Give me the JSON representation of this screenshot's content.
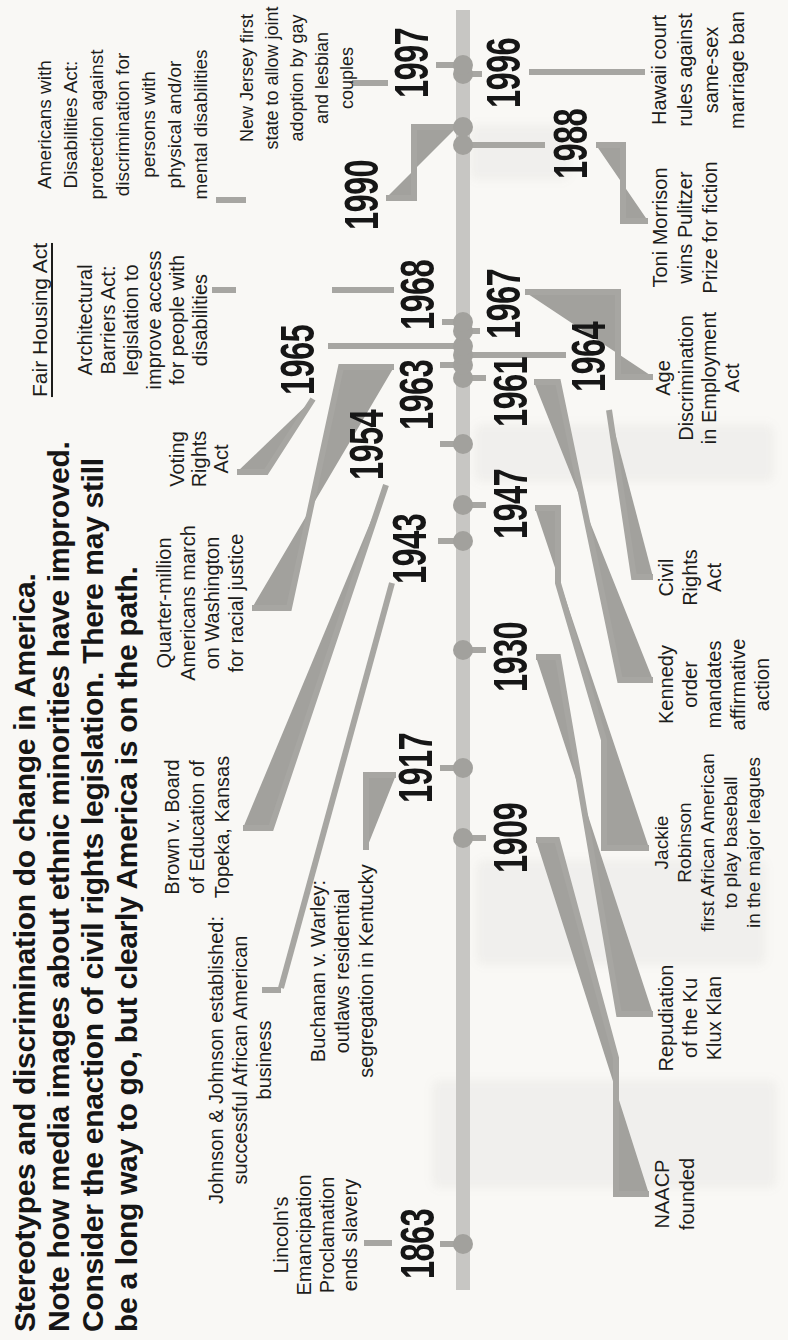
{
  "colors": {
    "ink": "#161616",
    "label": "#1d1d1b",
    "bar": "#c7c6c3",
    "dot": "#a2a19d",
    "line": "#a7a6a2",
    "paper": "#f9f8f5"
  },
  "title": {
    "text": "Stereotypes and discrimination do change in America.\nNote how media images about ethnic minorities have improved.\nConsider the enaction of civil rights legislation. There may still\nbe a long way to go, but clearly America is on the path."
  },
  "timeline": {
    "first_year": "1863",
    "last_year": "1997"
  },
  "events": [
    {
      "year": "1863",
      "side": "above",
      "label": "Lincoln's\nEmancipation\nProclamation\nends slavery"
    },
    {
      "year": "1909",
      "side": "below",
      "label": "NAACP\nfounded"
    },
    {
      "year": "1917",
      "side": "above",
      "label": "Buchanan v. Warley:\noutlaws residential\nsegregation in Kentucky"
    },
    {
      "year": "1930",
      "side": "below",
      "label": "Repudiation\nof the Ku\nKlux Klan"
    },
    {
      "year": "1943",
      "side": "above",
      "label": "Johnson & Johnson established:\nsuccessful African American\nbusiness"
    },
    {
      "year": "1947",
      "side": "below",
      "label": "Jackie\nRobinson\nfirst African American\nto play baseball\nin the major leagues"
    },
    {
      "year": "1954",
      "side": "above",
      "label": "Brown v. Board\nof Education of\nTopeka, Kansas"
    },
    {
      "year": "1961",
      "side": "below",
      "label": "Kennedy\norder\nmandates\naffirmative\naction"
    },
    {
      "year": "1963",
      "side": "above",
      "label": "Quarter-million\nAmericans march\non Washington\nfor racial justice"
    },
    {
      "year": "1964",
      "side": "below",
      "label": "Civil\nRights\nAct"
    },
    {
      "year": "1965",
      "side": "above",
      "label": "Voting\nRights\nAct"
    },
    {
      "year": "1967",
      "side": "below",
      "label": "Age\nDiscrimination\nin Employment\nAct"
    },
    {
      "year": "1968",
      "side": "above",
      "label_heading": "Fair Housing Act",
      "label": "Architectural\nBarriers Act:\nlegislation to\nimprove access\nfor people with\ndisabilities"
    },
    {
      "year": "1988",
      "side": "below",
      "label": "Toni Morrison\nwins Pulitzer\nPrize for fiction"
    },
    {
      "year": "1990",
      "side": "above",
      "label": "Americans with\nDisabilities Act:\nprotection against\ndiscrimination for\npersons with\nphysical and/or\nmental disabilities"
    },
    {
      "year": "1996",
      "side": "below",
      "label": "Hawaii court\nrules against\nsame-sex\nmarriage ban"
    },
    {
      "year": "1997",
      "side": "above",
      "label": "New Jersey first\nstate to allow joint\nadoption by gay\nand lesbian\ncouples"
    }
  ]
}
